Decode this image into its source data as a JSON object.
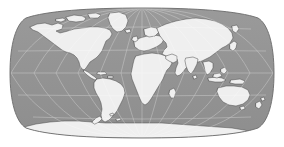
{
  "figure": {
    "width": 284,
    "height": 147,
    "background_color": "#ffffff",
    "title": ""
  },
  "map": {
    "name": "world-map",
    "projection": "Robinson",
    "central_meridian": 0,
    "central_parallel": 0,
    "extent_px": {
      "left": 10,
      "right": 274,
      "top": 8,
      "bottom": 138
    },
    "center_px": {
      "x": 142,
      "y": 73
    },
    "half_width_px": 132,
    "half_height_px": 65,
    "colors": {
      "ocean": "#949494",
      "ocean_shade": "#8d8d8d",
      "land": "#efefef",
      "land_edge": "#4a4a4a",
      "graticule": "#ffffff",
      "frame": "#6b6b6b",
      "background": "#ffffff"
    },
    "style": {
      "graticule_opacity": 0.45,
      "graticule_width_px": 0.6,
      "coastline_width_px": 0.5,
      "frame_width_px": 0.9
    },
    "graticule": {
      "meridian_step_deg": 30,
      "parallel_step_deg": 30,
      "meridians_deg": [
        -180,
        -150,
        -120,
        -90,
        -60,
        -30,
        0,
        30,
        60,
        90,
        120,
        150,
        180
      ],
      "parallels_deg": [
        -60,
        -30,
        0,
        30,
        60
      ],
      "labels_shown": false
    },
    "features": [
      {
        "name": "north-america",
        "label": "North America"
      },
      {
        "name": "greenland",
        "label": "Greenland"
      },
      {
        "name": "south-america",
        "label": "South America"
      },
      {
        "name": "africa",
        "label": "Africa"
      },
      {
        "name": "europe",
        "label": "Europe"
      },
      {
        "name": "asia",
        "label": "Asia"
      },
      {
        "name": "australia",
        "label": "Australia"
      },
      {
        "name": "antarctica",
        "label": "Antarctica"
      },
      {
        "name": "madagascar",
        "label": "Madagascar"
      },
      {
        "name": "japan",
        "label": "Japan"
      },
      {
        "name": "new-zealand",
        "label": "New Zealand"
      },
      {
        "name": "indonesia",
        "label": "Indonesia"
      },
      {
        "name": "british-isles",
        "label": "British Isles"
      },
      {
        "name": "iceland",
        "label": "Iceland"
      },
      {
        "name": "sri-lanka",
        "label": "Sri Lanka"
      },
      {
        "name": "cuba",
        "label": "Cuba"
      },
      {
        "name": "arctic-islands",
        "label": "Canadian Arctic Archipelago"
      }
    ]
  }
}
